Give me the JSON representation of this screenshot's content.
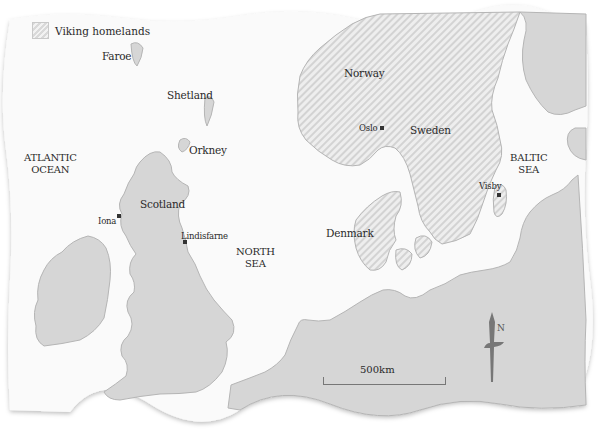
{
  "legend": {
    "label": "Viking homelands",
    "swatch": "diagonal-hatch"
  },
  "regions": {
    "faroe": "Faroe",
    "shetland": "Shetland",
    "orkney": "Orkney",
    "atlantic_ocean_line1": "ATLANTIC",
    "atlantic_ocean_line2": "OCEAN",
    "scotland": "Scotland",
    "iona": "Iona",
    "lindisfarne": "Lindisfarne",
    "north_sea_line1": "NORTH",
    "north_sea_line2": "SEA",
    "norway": "Norway",
    "oslo": "Oslo",
    "sweden": "Sweden",
    "denmark": "Denmark",
    "baltic_sea_line1": "BALTIC",
    "baltic_sea_line2": "SEA",
    "visby": "Visby"
  },
  "scale_bar": {
    "label": "500km"
  },
  "north_arrow": {
    "label": "N"
  },
  "colors": {
    "sea": "#fafafa",
    "land": "#d6d6d6",
    "homeland_hatch_light": "#efefef",
    "homeland_hatch_dark": "#d4d4d4",
    "coast": "#b5b5b5",
    "text": "#2a2a2a",
    "compass": "#777777"
  }
}
